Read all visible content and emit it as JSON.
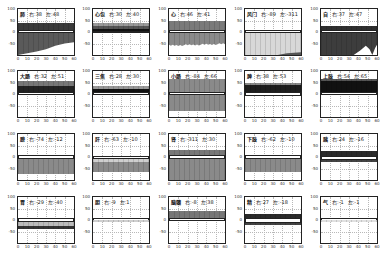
{
  "chart_data": [
    {
      "type": "area",
      "title": "肺",
      "right_label": "右:38",
      "left_label": "左:48",
      "ylim": [
        -100,
        100
      ],
      "xlim": [
        0,
        60
      ],
      "xticks": [
        0,
        10,
        20,
        30,
        40,
        50,
        60
      ],
      "yticks": [
        100,
        50,
        0,
        -50
      ],
      "bands": [
        {
          "from": 10,
          "to": 40,
          "color": "#3a3a3a"
        },
        {
          "from": -5,
          "to": 10,
          "color": "#ffffff",
          "border": "#222"
        },
        {
          "from": -100,
          "to": -5,
          "color": "#5a5a5a"
        }
      ],
      "cutout": {
        "type": "rising",
        "points": [
          [
            0,
            -100
          ],
          [
            20,
            -85
          ],
          [
            30,
            -75
          ],
          [
            40,
            -60
          ],
          [
            50,
            -50
          ],
          [
            60,
            -45
          ],
          [
            60,
            -100
          ]
        ],
        "color": "#ffffff"
      }
    },
    {
      "type": "area",
      "title": "心包",
      "right_label": "右:30",
      "left_label": "左:40",
      "ylim": [
        -100,
        100
      ],
      "xlim": [
        0,
        60
      ],
      "xticks": [
        0,
        10,
        20,
        30,
        40,
        50,
        60
      ],
      "yticks": [
        100,
        50,
        0,
        -50
      ],
      "bands": [
        {
          "from": 25,
          "to": 40,
          "color": "#999999"
        },
        {
          "from": 12,
          "to": 25,
          "color": "#555555"
        },
        {
          "from": 5,
          "to": 12,
          "color": "#111111"
        },
        {
          "from": -5,
          "to": 5,
          "color": "#ffffff",
          "border": "#222"
        }
      ]
    },
    {
      "type": "area",
      "title": "心",
      "right_label": "右:46",
      "left_label": "左:41",
      "ylim": [
        -100,
        100
      ],
      "xlim": [
        0,
        60
      ],
      "xticks": [
        0,
        10,
        20,
        30,
        40,
        50,
        60
      ],
      "yticks": [
        100,
        50,
        0,
        -50
      ],
      "bands": [
        {
          "from": 10,
          "to": 50,
          "color": "#7a7a7a"
        },
        {
          "from": -5,
          "to": 10,
          "color": "#ffffff",
          "border": "#222"
        },
        {
          "from": -60,
          "to": -5,
          "color": "#8a8a8a"
        }
      ],
      "noise_bottom": -50
    },
    {
      "type": "area",
      "title": "风门",
      "right_label": "右:-89",
      "left_label": "左:-311",
      "ylim": [
        -100,
        100
      ],
      "xlim": [
        0,
        60
      ],
      "xticks": [
        0,
        10,
        20,
        30,
        40,
        50,
        60
      ],
      "yticks": [
        100,
        50,
        0,
        -50
      ],
      "bands": [
        {
          "from": -5,
          "to": 10,
          "color": "#ffffff",
          "border": "#222"
        },
        {
          "from": -100,
          "to": -5,
          "color": "#d8d8d8"
        }
      ],
      "cutout": {
        "type": "rising_dark",
        "points": [
          [
            35,
            -100
          ],
          [
            45,
            -92
          ],
          [
            60,
            -88
          ],
          [
            60,
            -100
          ]
        ],
        "color": "#555555"
      }
    },
    {
      "type": "area",
      "title": "自",
      "right_label": "右:37",
      "left_label": "左:47",
      "ylim": [
        -100,
        100
      ],
      "xlim": [
        0,
        60
      ],
      "xticks": [
        0,
        10,
        20,
        30,
        40,
        50,
        60
      ],
      "yticks": [
        100,
        50,
        0,
        -50
      ],
      "bands": [
        {
          "from": 10,
          "to": 25,
          "color": "#2e2e2e"
        },
        {
          "from": -5,
          "to": 10,
          "color": "#ffffff",
          "border": "#222"
        },
        {
          "from": -100,
          "to": -5,
          "color": "#3d3d3d"
        }
      ],
      "cutout": {
        "type": "peaks",
        "points": [
          [
            35,
            -100
          ],
          [
            42,
            -80
          ],
          [
            48,
            -60
          ],
          [
            52,
            -75
          ],
          [
            55,
            -100
          ],
          [
            58,
            -70
          ],
          [
            60,
            -55
          ],
          [
            60,
            -100
          ]
        ],
        "color": "#ffffff"
      }
    },
    {
      "type": "area",
      "title": "大肠",
      "right_label": "右:32",
      "left_label": "左:51",
      "ylim": [
        -100,
        100
      ],
      "xlim": [
        0,
        60
      ],
      "xticks": [
        0,
        10,
        20,
        30,
        40,
        50,
        60
      ],
      "yticks": [
        100,
        50,
        0,
        -50
      ],
      "bands": [
        {
          "from": 35,
          "to": 55,
          "color": "#777777"
        },
        {
          "from": 10,
          "to": 35,
          "color": "#222222"
        },
        {
          "from": -5,
          "to": 10,
          "color": "#ffffff",
          "border": "#222"
        }
      ]
    },
    {
      "type": "area",
      "title": "三焦",
      "right_label": "右:28",
      "left_label": "左:30",
      "ylim": [
        -100,
        100
      ],
      "xlim": [
        0,
        60
      ],
      "xticks": [
        0,
        10,
        20,
        30,
        40,
        50,
        60
      ],
      "yticks": [
        100,
        50,
        0,
        -50
      ],
      "bands": [
        {
          "from": 20,
          "to": 35,
          "color": "#999999"
        },
        {
          "from": 10,
          "to": 20,
          "color": "#111111"
        },
        {
          "from": -5,
          "to": 10,
          "color": "#ffffff",
          "border": "#222"
        }
      ]
    },
    {
      "type": "area",
      "title": "小肠",
      "right_label": "右:-84",
      "left_label": "左:66",
      "ylim": [
        -100,
        100
      ],
      "xlim": [
        0,
        60
      ],
      "xticks": [
        0,
        10,
        20,
        30,
        40,
        50,
        60
      ],
      "yticks": [
        100,
        50,
        0,
        -50
      ],
      "bands": [
        {
          "from": 10,
          "to": 65,
          "color": "#8a8a8a"
        },
        {
          "from": -5,
          "to": 10,
          "color": "#ffffff",
          "border": "#222"
        },
        {
          "from": -75,
          "to": -5,
          "color": "#8a8a8a"
        }
      ]
    },
    {
      "type": "area",
      "title": "脾",
      "right_label": "右:38",
      "left_label": "左:53",
      "ylim": [
        -100,
        100
      ],
      "xlim": [
        0,
        60
      ],
      "xticks": [
        0,
        10,
        20,
        30,
        40,
        50,
        60
      ],
      "yticks": [
        100,
        50,
        0,
        -50
      ],
      "bands": [
        {
          "from": 40,
          "to": 50,
          "color": "#888888"
        },
        {
          "from": 10,
          "to": 40,
          "color": "#1e1e1e"
        },
        {
          "from": -10,
          "to": 10,
          "color": "#ffffff",
          "border": "#222"
        }
      ]
    },
    {
      "type": "area",
      "title": "上肢",
      "right_label": "右:54",
      "left_label": "左:65",
      "ylim": [
        -100,
        100
      ],
      "xlim": [
        0,
        60
      ],
      "xticks": [
        0,
        10,
        20,
        30,
        40,
        50,
        60
      ],
      "yticks": [
        100,
        50,
        0,
        -50
      ],
      "bands": [
        {
          "from": 55,
          "to": 65,
          "color": "#555555"
        },
        {
          "from": 10,
          "to": 55,
          "color": "#111111"
        },
        {
          "from": -5,
          "to": 10,
          "color": "#ffffff",
          "border": "#222"
        }
      ]
    },
    {
      "type": "area",
      "title": "膀",
      "right_label": "右:-74",
      "left_label": "左:-12",
      "ylim": [
        -100,
        100
      ],
      "xlim": [
        0,
        60
      ],
      "xticks": [
        0,
        10,
        20,
        30,
        40,
        50,
        60
      ],
      "yticks": [
        100,
        50,
        0,
        -50
      ],
      "bands": [
        {
          "from": -10,
          "to": 10,
          "color": "#ffffff",
          "border": "#222"
        },
        {
          "from": -75,
          "to": -10,
          "color": "#8a8a8a"
        }
      ]
    },
    {
      "type": "area",
      "title": "肝",
      "right_label": "右:-63",
      "left_label": "左:-10",
      "ylim": [
        -100,
        100
      ],
      "xlim": [
        0,
        60
      ],
      "xticks": [
        0,
        10,
        20,
        30,
        40,
        50,
        60
      ],
      "yticks": [
        100,
        50,
        0,
        -50
      ],
      "bands": [
        {
          "from": -10,
          "to": 5,
          "color": "#ffffff",
          "border": "#222"
        },
        {
          "from": -20,
          "to": -10,
          "color": "#cfcfcf"
        },
        {
          "from": -65,
          "to": -20,
          "color": "#8a8a8a"
        }
      ]
    },
    {
      "type": "area",
      "title": "肾",
      "right_label": "右:-311",
      "left_label": "左:30",
      "ylim": [
        -100,
        100
      ],
      "xlim": [
        0,
        60
      ],
      "xticks": [
        0,
        10,
        20,
        30,
        40,
        50,
        60
      ],
      "yticks": [
        100,
        50,
        0,
        -50
      ],
      "bands": [
        {
          "from": 10,
          "to": 30,
          "color": "#777777"
        },
        {
          "from": -10,
          "to": 10,
          "color": "#ffffff",
          "border": "#222"
        },
        {
          "from": -100,
          "to": -10,
          "color": "#8a8a8a"
        }
      ]
    },
    {
      "type": "area",
      "title": "下肢",
      "right_label": "右:-62",
      "left_label": "左:-10",
      "ylim": [
        -100,
        100
      ],
      "xlim": [
        0,
        60
      ],
      "xticks": [
        0,
        10,
        20,
        30,
        40,
        50,
        60
      ],
      "yticks": [
        100,
        50,
        0,
        -50
      ],
      "bands": [
        {
          "from": -10,
          "to": 10,
          "color": "#ffffff",
          "border": "#222"
        },
        {
          "from": -65,
          "to": -10,
          "color": "#8a8a8a"
        }
      ]
    },
    {
      "type": "area",
      "title": "胰",
      "right_label": "右:24",
      "left_label": "左:-16",
      "ylim": [
        -100,
        100
      ],
      "xlim": [
        0,
        60
      ],
      "xticks": [
        0,
        10,
        20,
        30,
        40,
        50,
        60
      ],
      "yticks": [
        100,
        50,
        0,
        -50
      ],
      "bands": [
        {
          "from": 5,
          "to": 25,
          "color": "#2a2a2a"
        },
        {
          "from": -15,
          "to": 5,
          "color": "#ffffff",
          "border": "#222"
        },
        {
          "from": -22,
          "to": -15,
          "color": "#444444"
        }
      ]
    },
    {
      "type": "area",
      "title": "胃",
      "right_label": "右:-29",
      "left_label": "左:-40",
      "ylim": [
        -100,
        100
      ],
      "xlim": [
        0,
        60
      ],
      "xticks": [
        0,
        10,
        20,
        30,
        40,
        50,
        60
      ],
      "yticks": [
        100,
        50,
        0,
        -50
      ],
      "bands": [
        {
          "from": -10,
          "to": 10,
          "color": "#ffffff",
          "border": "#222"
        },
        {
          "from": -25,
          "to": -10,
          "color": "#bbbbbb"
        },
        {
          "from": -40,
          "to": -25,
          "color": "#333333"
        }
      ]
    },
    {
      "type": "area",
      "title": "胆",
      "right_label": "右:-9",
      "left_label": "左:1",
      "ylim": [
        -100,
        100
      ],
      "xlim": [
        0,
        60
      ],
      "xticks": [
        0,
        10,
        20,
        30,
        40,
        50,
        60
      ],
      "yticks": [
        100,
        50,
        0,
        -50
      ],
      "bands": [
        {
          "from": -10,
          "to": 10,
          "color": "#ffffff",
          "border": "#222"
        },
        {
          "from": -10,
          "to": -2,
          "color": "#cfcfcf"
        }
      ]
    },
    {
      "type": "area",
      "title": "脑髓",
      "right_label": "右:-8",
      "left_label": "左:38",
      "ylim": [
        -100,
        100
      ],
      "xlim": [
        0,
        60
      ],
      "xticks": [
        0,
        10,
        20,
        30,
        40,
        50,
        60
      ],
      "yticks": [
        100,
        50,
        0,
        -50
      ],
      "bands": [
        {
          "from": 10,
          "to": 40,
          "color": "#777777"
        },
        {
          "from": -5,
          "to": 10,
          "color": "#ffffff",
          "border": "#222"
        }
      ]
    },
    {
      "type": "area",
      "title": "精",
      "right_label": "右:27",
      "left_label": "左:-18",
      "ylim": [
        -100,
        100
      ],
      "xlim": [
        0,
        60
      ],
      "xticks": [
        0,
        10,
        20,
        30,
        40,
        50,
        60
      ],
      "yticks": [
        100,
        50,
        0,
        -50
      ],
      "bands": [
        {
          "from": 10,
          "to": 28,
          "color": "#2a2a2a"
        },
        {
          "from": -12,
          "to": 10,
          "color": "#ffffff",
          "border": "#222"
        },
        {
          "from": -20,
          "to": -12,
          "color": "#444444"
        }
      ]
    },
    {
      "type": "area",
      "title": "气",
      "right_label": "右:-1",
      "left_label": "左:-1",
      "ylim": [
        -100,
        100
      ],
      "xlim": [
        0,
        60
      ],
      "xticks": [
        0,
        10,
        20,
        30,
        40,
        50,
        60
      ],
      "yticks": [
        100,
        50,
        0,
        -50
      ],
      "bands": [
        {
          "from": -8,
          "to": 10,
          "color": "#ffffff",
          "border": "#222"
        },
        {
          "from": -8,
          "to": 0,
          "color": "#e0e0e0"
        }
      ]
    }
  ]
}
